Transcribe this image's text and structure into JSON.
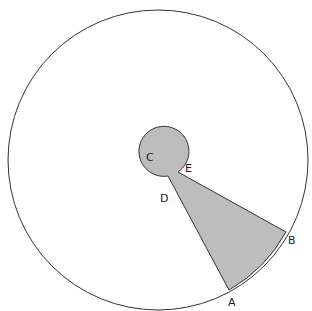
{
  "labels": {
    "A": "A",
    "B": "B",
    "C": "C",
    "D": "D",
    "E": "E"
  },
  "colors": {
    "shade": "#bdbdbd",
    "stroke": "#333333"
  }
}
